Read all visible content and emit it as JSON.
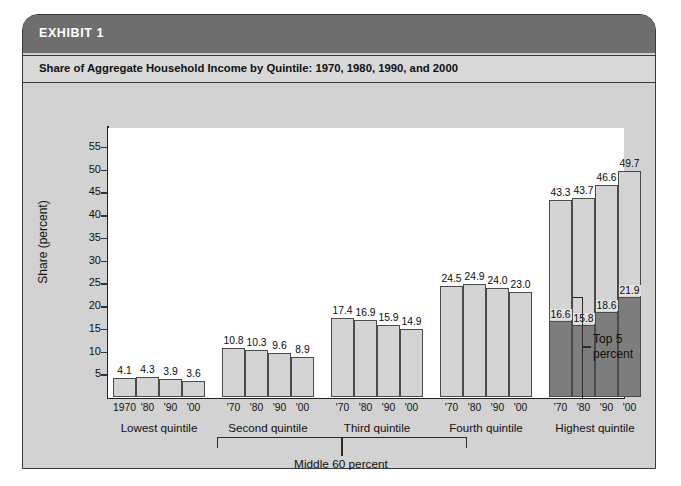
{
  "exhibit": {
    "label": "EXHIBIT 1",
    "subtitle": "Share of Aggregate Household Income by Quintile: 1970, 1980, 1990, and 2000"
  },
  "annotations": {
    "middle_60": "Middle 60 percent",
    "top5_line1": "Top 5",
    "top5_line2": "percent"
  },
  "colors": {
    "header_bar": "#6e6e6e",
    "subtitle_bar": "#d8d8d8",
    "panel_background": "#d2d2d2",
    "bar_light": "#d4d4d4",
    "bar_dark": "#7d7d7d",
    "axis": "#222222"
  },
  "chart_data": {
    "type": "bar",
    "title": "Share of Aggregate Household Income by Quintile: 1970, 1980, 1990, and 2000",
    "xlabel": "",
    "ylabel": "Share (percent)",
    "ylim": [
      0,
      57
    ],
    "yticks": [
      5,
      10,
      15,
      20,
      25,
      30,
      35,
      40,
      45,
      50,
      55
    ],
    "grid": false,
    "legend": "none",
    "x": [
      "1970",
      "1980",
      "1990",
      "2000"
    ],
    "groups": [
      {
        "name": "Lowest quintile",
        "year_labels": [
          "1970",
          "'80",
          "'90",
          "'00"
        ],
        "values": [
          4.1,
          4.3,
          3.9,
          3.6
        ],
        "value_labels": [
          "4.1",
          "4.3",
          "3.9",
          "3.6"
        ]
      },
      {
        "name": "Second quintile",
        "year_labels": [
          "'70",
          "'80",
          "'90",
          "'00"
        ],
        "values": [
          10.8,
          10.3,
          9.6,
          8.9
        ],
        "value_labels": [
          "10.8",
          "10.3",
          "9.6",
          "8.9"
        ]
      },
      {
        "name": "Third quintile",
        "year_labels": [
          "'70",
          "'80",
          "'90",
          "'00"
        ],
        "values": [
          17.4,
          16.9,
          15.9,
          14.9
        ],
        "value_labels": [
          "17.4",
          "16.9",
          "15.9",
          "14.9"
        ]
      },
      {
        "name": "Fourth quintile",
        "year_labels": [
          "'70",
          "'80",
          "'90",
          "'00"
        ],
        "values": [
          24.5,
          24.9,
          24.0,
          23.0
        ],
        "value_labels": [
          "24.5",
          "24.9",
          "24.0",
          "23.0"
        ]
      },
      {
        "name": "Highest quintile",
        "year_labels": [
          "'70",
          "'80",
          "'90",
          "'00"
        ],
        "values": [
          43.3,
          43.7,
          46.6,
          49.7
        ],
        "value_labels": [
          "43.3",
          "43.7",
          "46.6",
          "49.7"
        ],
        "sub_series_name": "Top 5 percent",
        "sub_values": [
          16.6,
          15.8,
          18.6,
          21.9
        ],
        "sub_value_labels": [
          "16.6",
          "15.8",
          "18.6",
          "21.9"
        ]
      }
    ]
  }
}
